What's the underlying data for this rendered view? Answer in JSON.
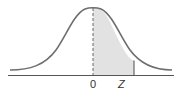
{
  "diagram": {
    "type": "standard-normal-curve",
    "labels": {
      "mean": "0",
      "z": "Z"
    },
    "shaded_region": "area between 0 and z",
    "colors": {
      "curve": "#6e6e6e",
      "shade": "#e2e2e2",
      "axis": "#555555"
    }
  }
}
